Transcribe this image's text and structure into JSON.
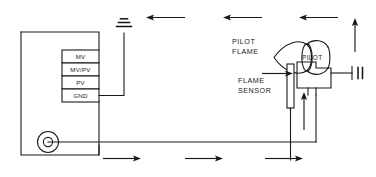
{
  "diagram": {
    "labels": {
      "pilot_flame_line1": "PILOT",
      "pilot_flame_line2": "FLAME",
      "flame_sensor_line1": "FLAME",
      "flame_sensor_line2": "SENSOR",
      "pilot_body": "PILOT"
    },
    "terminal_block": {
      "terminals": [
        {
          "label": "MV"
        },
        {
          "label": "MV/PV"
        },
        {
          "label": "PV"
        },
        {
          "label": "GND"
        }
      ]
    },
    "icons": {
      "ground": "ground-icon",
      "spark_igniter": "spark-igniter-icon",
      "valve_port": "valve-port-icon",
      "flame": "flame-icon"
    },
    "flow_arrows": {
      "top_return_count": 3,
      "top_return_direction": "left",
      "bottom_supply_count": 3,
      "bottom_supply_direction": "right",
      "vent_direction": "up",
      "sensor_feed_direction": "up",
      "pilot_feed_direction": "right"
    },
    "colors": {
      "line": "#1a1a1a",
      "background": "#ffffff"
    }
  }
}
